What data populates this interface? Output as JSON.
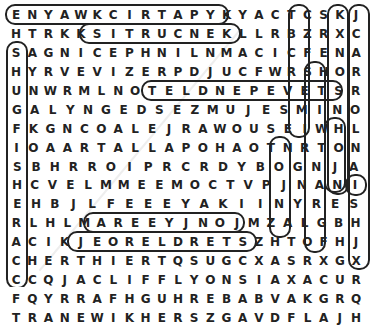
{
  "puzzle": {
    "type": "word-search",
    "rows": [
      "ENYAWKCIRTAPYKYACTCSKJ",
      "HTRKKSITRUCNEKLLRBZRXC",
      "SAGNICEPHNILNMACICFENA",
      "HYRVEVIZERPDJUCFWRSHOR",
      "UNWRMLNOTELDNEPEVETSR",
      "GALYNGEDSEZMUJESMINO",
      "FKGNCOALEJRAWOUSEIWHL",
      "IOAARTALLAPOHAOTNRTON",
      "SBHRROIPRCRDYBOGNJA",
      "HCVELMMEEMOCTVPJNANI",
      "EHBJLFEEEYAKIINYRES",
      "RLHLMAREEYJNOJMZALGBH",
      "ACIKJEORELDRETSZHTOFHJ",
      "CHERTHIERTQSUGCXASRXGX",
      "CCQJACLIFFLYONSIAXACUR",
      "FQYRRAFHGUHREBABVAKGRQ",
      "TRANEWIKHERSZGAVDFLAJH"
    ],
    "found_words": [
      "PATRICKWAYNE",
      "KURTSIKKING",
      "STEVEPENDLETON",
      "CLIFFLYONS",
      "HUGHFARR",
      "ARKANSAS",
      "SHERIFF",
      "JOHNWAYNE"
    ]
  }
}
